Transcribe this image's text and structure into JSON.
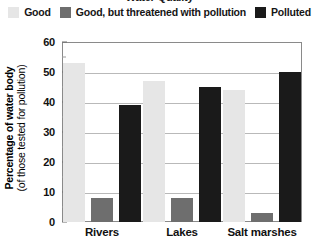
{
  "title_remnant": "Water Quality",
  "legend": {
    "items": [
      {
        "label": "Good",
        "color": "#e6e6e6"
      },
      {
        "label": "Good, but threatened with pollution",
        "color": "#6e6e6e"
      },
      {
        "label": "Polluted",
        "color": "#1a1a1a"
      }
    ]
  },
  "axis": {
    "ylabel_main": "Percentage of water body",
    "ylabel_sub": "(of those tested for pollution)",
    "ticks": [
      "0",
      "10",
      "20",
      "30",
      "40",
      "50",
      "60"
    ]
  },
  "chart_data": {
    "type": "bar",
    "title": "Water Quality",
    "xlabel": "",
    "ylabel": "Percentage of water body (of those tested for pollution)",
    "ylim": [
      0,
      60
    ],
    "ytick_interval": 10,
    "yminor_interval": 5,
    "grid": true,
    "legend_position": "top",
    "categories": [
      "Rivers",
      "Lakes",
      "Salt marshes"
    ],
    "series": [
      {
        "name": "Good",
        "color": "#e6e6e6",
        "values": [
          53,
          47,
          44
        ]
      },
      {
        "name": "Good, but threatened with pollution",
        "color": "#6e6e6e",
        "values": [
          8,
          8,
          3
        ]
      },
      {
        "name": "Polluted",
        "color": "#1a1a1a",
        "values": [
          39,
          45,
          50
        ]
      }
    ]
  }
}
